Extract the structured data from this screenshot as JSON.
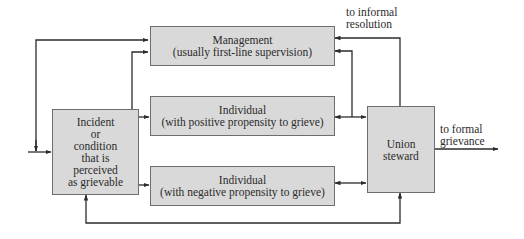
{
  "diagram": {
    "nodes": {
      "management": {
        "line1": "Management",
        "line2": "(usually first-line supervision)"
      },
      "individual_positive": {
        "line1": "Individual",
        "line2": "(with positive propensity to grieve)"
      },
      "individual_negative": {
        "line1": "Individual",
        "line2": "(with negative propensity to grieve)"
      },
      "incident": {
        "lines": [
          "Incident",
          "or",
          "condition",
          "that is",
          "perceived",
          "as grievable"
        ]
      },
      "union_steward": {
        "line1": "Union",
        "line2": "steward"
      }
    },
    "labels": {
      "informal": {
        "line1": "to informal",
        "line2": "resolution"
      },
      "formal": {
        "line1": "to formal",
        "line2": "grievance"
      }
    },
    "edges": [
      {
        "from": "external",
        "to": "incident"
      },
      {
        "from": "incident",
        "to": "management"
      },
      {
        "from": "incident",
        "to": "individual_positive"
      },
      {
        "from": "incident",
        "to": "individual_negative"
      },
      {
        "from": "feedback_left",
        "to": "management"
      },
      {
        "from": "individual_positive",
        "to": "union_steward",
        "bidirectional": true
      },
      {
        "from": "individual_negative",
        "to": "union_steward",
        "bidirectional": true
      },
      {
        "from": "union_steward",
        "to": "management",
        "label": "to informal resolution"
      },
      {
        "from": "individual_positive_link",
        "to": "management"
      },
      {
        "from": "union_steward",
        "to": "incident",
        "path": "bottom loop"
      },
      {
        "from": "union_steward",
        "to": "formal_grievance",
        "label": "to formal grievance"
      }
    ],
    "colors": {
      "box_fill": "#d9d9d9",
      "box_border": "#6e6e6e",
      "line": "#2b2b2b",
      "text": "#2b2b2b"
    }
  }
}
